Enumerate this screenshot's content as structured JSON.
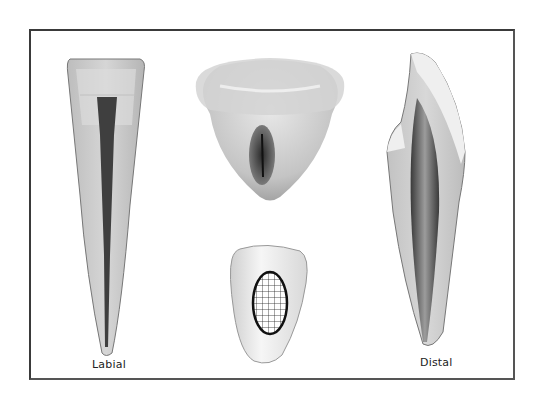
{
  "figure": {
    "labels": {
      "left": "Labial",
      "right": "Distal"
    },
    "views": [
      {
        "name": "labial-section",
        "description": "Longitudinal labial section of tooth with pulp canal"
      },
      {
        "name": "incisal-cross-section",
        "description": "Cross-sectional view of crown showing pulp"
      },
      {
        "name": "distal-section",
        "description": "Longitudinal distal section of tooth with pulp chamber"
      },
      {
        "name": "cervical-cross-section",
        "description": "Cross section with hatched pulp area"
      }
    ],
    "colors": {
      "border": "#3a3a3a",
      "enamel": "#ededed",
      "dentin": "#c9c9c9",
      "pulp": "#3d3d3d",
      "hatch": "#111111"
    }
  }
}
